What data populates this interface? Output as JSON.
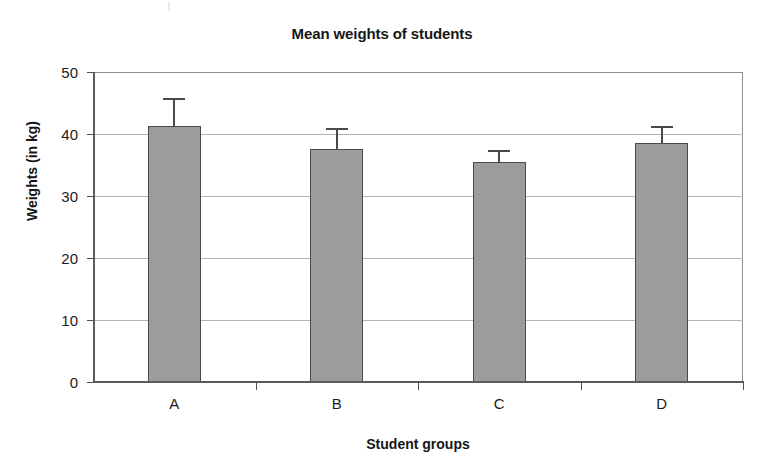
{
  "chart_data": {
    "type": "bar",
    "title": "Mean weights of students",
    "xlabel": "Student groups",
    "ylabel": "Weights (in kg)",
    "categories": [
      "A",
      "B",
      "C",
      "D"
    ],
    "values": [
      41.3,
      37.6,
      35.5,
      38.5
    ],
    "errors": [
      4.5,
      3.4,
      1.9,
      2.8
    ],
    "error_upper": [
      45.8,
      41.0,
      37.4,
      41.3
    ],
    "series": [
      {
        "name": "Mean weight",
        "values": [
          41.3,
          37.6,
          35.5,
          38.5
        ],
        "errors": [
          4.5,
          3.4,
          1.9,
          2.8
        ]
      }
    ],
    "ylim": [
      0,
      50
    ],
    "yticks": [
      0,
      10,
      20,
      30,
      40,
      50
    ],
    "ytick_labels": [
      "0",
      "10",
      "20",
      "30",
      "40",
      "50"
    ],
    "grid": "horizontal",
    "legend": "none",
    "bar_color": "#9c9c9c",
    "bar_edge_color": "#4a4a4a",
    "gridline_color": "#b4b4b4",
    "axis_color": "#5b5b5b"
  }
}
